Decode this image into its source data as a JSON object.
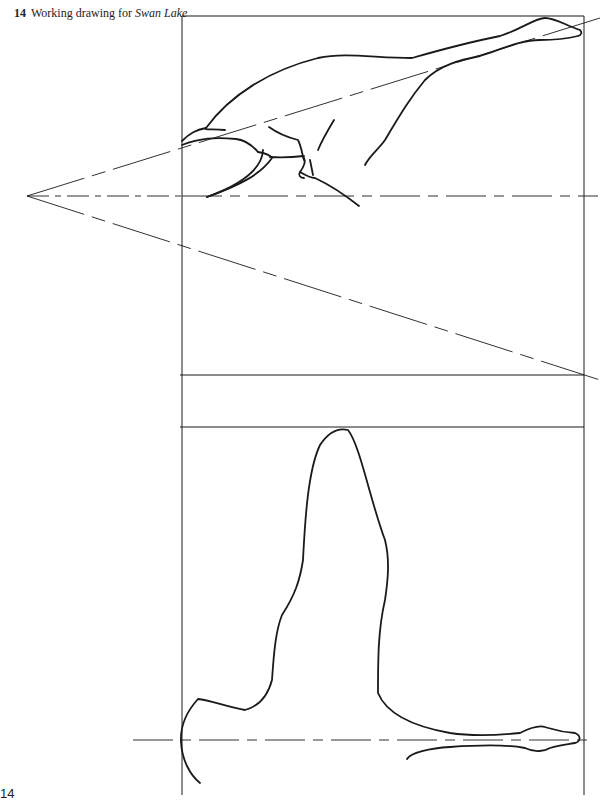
{
  "caption": {
    "number": "14",
    "text": "Working drawing for",
    "title": "Swan Lake"
  },
  "page_number": "14",
  "figure": {
    "line_color": "#1a1a1a",
    "panels": [
      "side-view",
      "divider-band",
      "pose-outline"
    ]
  }
}
